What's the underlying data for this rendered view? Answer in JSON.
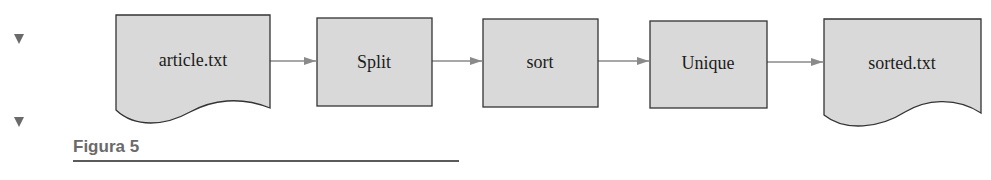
{
  "diagram": {
    "nodes": [
      {
        "id": "n1",
        "label": "article.txt",
        "shape": "document"
      },
      {
        "id": "n2",
        "label": "Split",
        "shape": "process"
      },
      {
        "id": "n3",
        "label": "sort",
        "shape": "process"
      },
      {
        "id": "n4",
        "label": "Unique",
        "shape": "process"
      },
      {
        "id": "n5",
        "label": "sorted.txt",
        "shape": "document"
      }
    ],
    "edges": [
      {
        "from": "n1",
        "to": "n2"
      },
      {
        "from": "n2",
        "to": "n3"
      },
      {
        "from": "n3",
        "to": "n4"
      },
      {
        "from": "n4",
        "to": "n5"
      }
    ]
  },
  "caption": {
    "text": "Figura 5"
  },
  "colors": {
    "node_fill": "#d9d9d9",
    "stroke": "#333333",
    "arrow": "#8a8a8a",
    "caption": "#6a6a6a"
  },
  "markers": [
    {
      "icon": "triangle-down-icon"
    },
    {
      "icon": "triangle-down-icon"
    }
  ]
}
